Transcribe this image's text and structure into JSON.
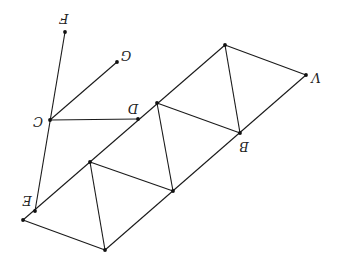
{
  "diagram": {
    "type": "geometry-figure",
    "orientation": "rotated-180-degrees",
    "background": "#ffffff",
    "line_color": "#1a1a1a",
    "points": {
      "F": {
        "x": 65,
        "y": 32,
        "label": "F",
        "lx": 64,
        "ly": 18
      },
      "G": {
        "x": 117,
        "y": 62,
        "label": "G",
        "lx": 126,
        "ly": 55
      },
      "C": {
        "x": 50,
        "y": 120,
        "label": "C",
        "lx": 38,
        "ly": 121
      },
      "D": {
        "x": 138,
        "y": 119,
        "label": "D",
        "lx": 133,
        "ly": 108
      },
      "A": {
        "x": 306,
        "y": 75,
        "label": "V",
        "lx": 316,
        "ly": 77
      },
      "B": {
        "x": 240,
        "y": 133,
        "label": "B",
        "lx": 244,
        "ly": 146
      },
      "E": {
        "x": 35,
        "y": 211,
        "label": "E",
        "lx": 27,
        "ly": 200
      },
      "P1": {
        "x": 225,
        "y": 45,
        "label": ""
      },
      "P2": {
        "x": 157,
        "y": 103,
        "label": ""
      },
      "P3": {
        "x": 173,
        "y": 191,
        "label": ""
      },
      "P4": {
        "x": 90,
        "y": 162,
        "label": ""
      },
      "P5": {
        "x": 23,
        "y": 220,
        "label": ""
      },
      "P6": {
        "x": 105,
        "y": 250,
        "label": ""
      }
    },
    "segments": [
      [
        "P5",
        "P1"
      ],
      [
        "P6",
        "A"
      ],
      [
        "P1",
        "A"
      ],
      [
        "P1",
        "B"
      ],
      [
        "P2",
        "B"
      ],
      [
        "P2",
        "P3"
      ],
      [
        "P4",
        "P3"
      ],
      [
        "P4",
        "P6"
      ],
      [
        "P5",
        "P6"
      ],
      [
        "F",
        "E"
      ],
      [
        "C",
        "G"
      ],
      [
        "C",
        "D"
      ]
    ]
  }
}
